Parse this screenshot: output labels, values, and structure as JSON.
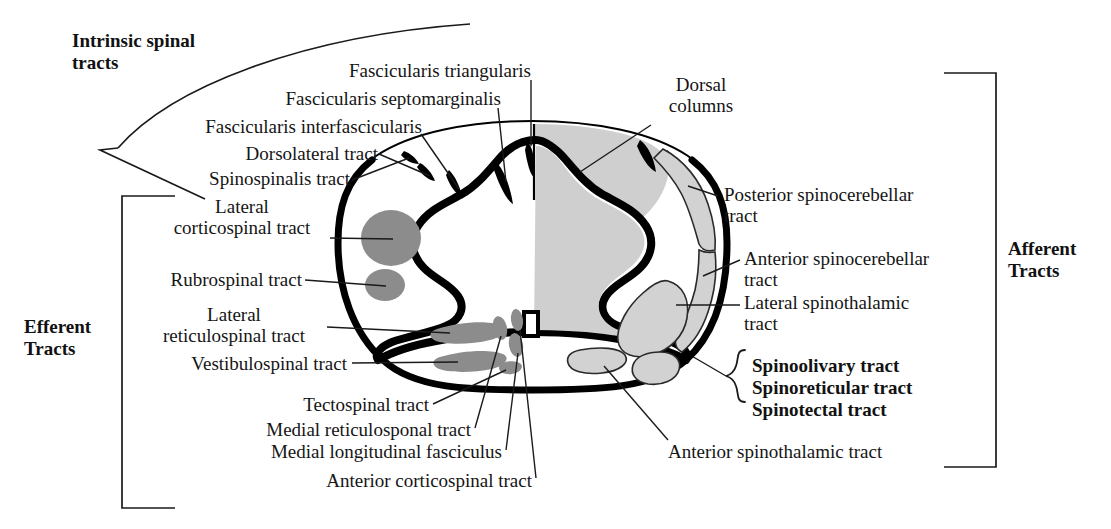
{
  "figure": {
    "colors": {
      "outline": "#000000",
      "efferent_fill": "#8c8c8c",
      "afferent_fill": "#d2d2d2",
      "dorsal_column_fill": "#cfcfcf",
      "black_fasciculi": "#000000",
      "background": "#ffffff",
      "leader_line": "#1a1a1a"
    }
  },
  "groups": {
    "intrinsic": "Intrinsic spinal\ntracts",
    "efferent": "Efferent\nTracts",
    "afferent": "Afferent\nTracts"
  },
  "labels": {
    "fascicularis_triangularis": "Fascicularis triangularis",
    "fascicularis_septomarginalis": "Fascicularis septomarginalis",
    "fascicularis_interfascicularis": "Fascicularis interfascicularis",
    "dorsolateral_tract": "Dorsolateral tract",
    "spinospinalis_tract": "Spinospinalis tract",
    "dorsal_columns": "Dorsal\ncolumns",
    "posterior_spinocerebellar": "Posterior spinocerebellar\ntract",
    "anterior_spinocerebellar": "Anterior spinocerebellar\ntract",
    "lateral_spinothalamic": "Lateral spinothalamic\ntract",
    "lateral_corticospinal": "Lateral\ncorticospinal tract",
    "rubrospinal": "Rubrospinal tract",
    "lateral_reticulospinal": "Lateral\nreticulospinal tract",
    "vestibulospinal": "Vestibulospinal tract",
    "tectospinal": "Tectospinal tract",
    "medial_reticulosponal": "Medial reticulosponal tract",
    "medial_longitudinal_fasciculus": "Medial longitudinal fasciculus",
    "anterior_corticospinal": "Anterior corticospinal tract",
    "spinoolivary": "Spinoolivary tract",
    "spinoreticular": "Spinoreticular tract",
    "spinotectal": "Spinotectal tract",
    "anterior_spinothalamic": "Anterior spinothalamic tract"
  }
}
